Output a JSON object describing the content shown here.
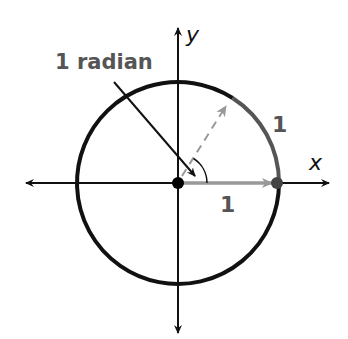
{
  "diagram": {
    "type": "unit-circle-radian",
    "labels": {
      "radian_label": "1 radian",
      "arc_length_label": "1",
      "radius_label": "1",
      "x_axis": "x",
      "y_axis": "y"
    },
    "geometry": {
      "center": [
        178,
        183
      ],
      "radius": 101,
      "angle_radians": 1
    },
    "colors": {
      "circle": "#111111",
      "axes": "#111111",
      "highlight_arc": "#555555",
      "radius_arrow": "#999999",
      "dashed_radius": "#999999",
      "label_text": "#555555",
      "background": "#ffffff"
    }
  }
}
